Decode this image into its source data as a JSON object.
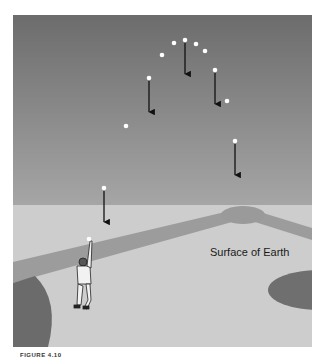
{
  "figure": {
    "label_surface": "Surface of Earth",
    "caption_partial": "FIGURE 4.10",
    "colors": {
      "sky_top": "#6e6e6e",
      "sky_bottom": "#a2a2a2",
      "ground": "#cfcfcf",
      "base_path": "#9a9a9a",
      "dark_grass": "#6a6a6a",
      "ball": "#ffffff",
      "arrow": "#111111"
    },
    "trajectory_points": [
      {
        "x": 89,
        "y": 239
      },
      {
        "x": 104,
        "y": 188
      },
      {
        "x": 126,
        "y": 126
      },
      {
        "x": 149,
        "y": 78
      },
      {
        "x": 162,
        "y": 55
      },
      {
        "x": 174,
        "y": 43
      },
      {
        "x": 185,
        "y": 40
      },
      {
        "x": 196,
        "y": 44
      },
      {
        "x": 205,
        "y": 51
      },
      {
        "x": 215,
        "y": 70
      },
      {
        "x": 227,
        "y": 101
      },
      {
        "x": 235,
        "y": 141
      }
    ],
    "gravity_arrows": [
      {
        "x": 104,
        "y1": 191,
        "y2": 222
      },
      {
        "x": 149,
        "y1": 81,
        "y2": 112
      },
      {
        "x": 185,
        "y1": 43,
        "y2": 74
      },
      {
        "x": 215,
        "y1": 73,
        "y2": 104
      },
      {
        "x": 235,
        "y1": 144,
        "y2": 175
      }
    ]
  }
}
